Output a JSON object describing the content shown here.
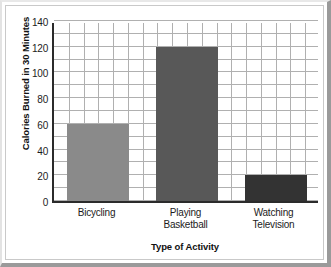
{
  "chart_data": {
    "type": "bar",
    "title": "",
    "subtitle": "",
    "xlabel": "Type of Activity",
    "ylabel": "Calories Burned in 30 Minutes",
    "categories": [
      "Bicycling",
      "Playing Basketball",
      "Watching Television"
    ],
    "values": [
      60,
      120,
      20
    ],
    "bar_colors": [
      "#8a8a8a",
      "#585858",
      "#333333"
    ],
    "ylim": [
      0,
      140
    ],
    "ytick_labels": [
      "0",
      "20",
      "40",
      "60",
      "80",
      "100",
      "120",
      "140"
    ],
    "ytick_values": [
      0,
      20,
      40,
      60,
      80,
      100,
      120,
      140
    ],
    "ytick_minor_step": 10,
    "xtick_label_lines": [
      [
        "Bicycling"
      ],
      [
        "Playing",
        "Basketball"
      ],
      [
        "Watching",
        "Television"
      ]
    ],
    "grid": true,
    "grid_color": "#b0b0b0",
    "legend": "none",
    "axis_color": "#2b2b2b",
    "plot_background": "#ffffff",
    "frame_color": "#9a9a9a"
  }
}
